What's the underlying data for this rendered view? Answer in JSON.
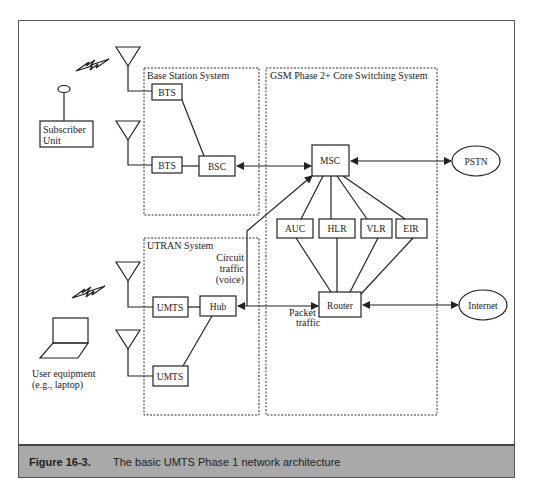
{
  "figure": {
    "number": "Figure 16-3.",
    "caption": "The basic UMTS Phase 1 network architecture"
  },
  "groups": {
    "base_station": "Base Station System",
    "core": "GSM Phase 2+ Core Switching System",
    "utran": "UTRAN  System"
  },
  "nodes": {
    "bts1": "BTS",
    "bts2": "BTS",
    "bsc": "BSC",
    "msc": "MSC",
    "pstn": "PSTN",
    "auc": "AUC",
    "hlr": "HLR",
    "vlr": "VLR",
    "eir": "EIR",
    "router": "Router",
    "internet": "Internet",
    "umts1": "UMTS",
    "umts2": "UMTS",
    "hub": "Hub"
  },
  "labels": {
    "subscriber_line1": "Subscriber",
    "subscriber_line2": "Unit",
    "user_eq_line1": "User equipment",
    "user_eq_line2": "(e.g., laptop)",
    "circuit_line1": "Circuit",
    "circuit_line2": "traffic",
    "circuit_line3": "(voice)",
    "packet_line1": "Packet",
    "packet_line2": "traffic"
  }
}
